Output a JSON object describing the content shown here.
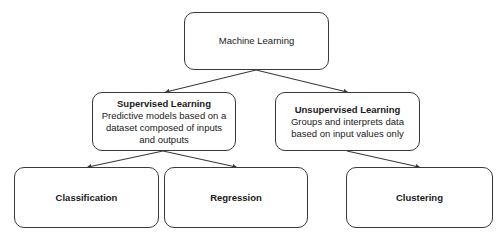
{
  "root": {
    "title": "Machine Learning"
  },
  "supervised": {
    "title": "Supervised Learning",
    "description": "Predictive models based on a dataset composed of inputs and outputs"
  },
  "unsupervised": {
    "title": "Unsupervised Learning",
    "description": "Groups and interprets data based on input values only"
  },
  "leaves": [
    {
      "title": "Classification"
    },
    {
      "title": "Regression"
    },
    {
      "title": "Clustering"
    }
  ],
  "edges": [
    {
      "from": "Machine Learning",
      "to": "Supervised Learning"
    },
    {
      "from": "Machine Learning",
      "to": "Unsupervised Learning"
    },
    {
      "from": "Supervised Learning",
      "to": "Classification"
    },
    {
      "from": "Supervised Learning",
      "to": "Regression"
    },
    {
      "from": "Unsupervised Learning",
      "to": "Clustering"
    }
  ],
  "colors": {
    "line": "#3a3a3a",
    "background": "#ffffff"
  }
}
